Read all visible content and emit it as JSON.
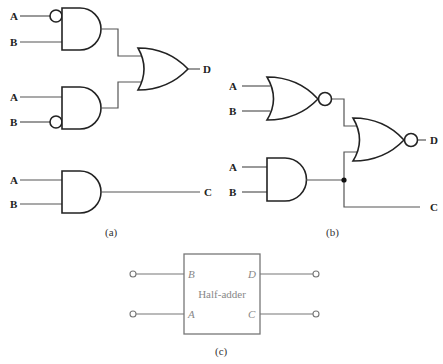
{
  "figure_a": {
    "caption": "(a)",
    "gate1": {
      "type": "AND",
      "inputs": [
        "A",
        "B"
      ],
      "inverted_inputs": [
        "A"
      ]
    },
    "gate2": {
      "type": "AND",
      "inputs": [
        "A",
        "B"
      ],
      "inverted_inputs": [
        "B"
      ]
    },
    "gate3": {
      "type": "OR",
      "output": "D"
    },
    "gate4": {
      "type": "AND",
      "inputs": [
        "A",
        "B"
      ],
      "output": "C"
    },
    "labels": {
      "a1": "A",
      "b1": "B",
      "a2": "A",
      "b2": "B",
      "a3": "A",
      "b3": "B",
      "d": "D",
      "c": "C"
    }
  },
  "figure_b": {
    "caption": "(b)",
    "gate1": {
      "type": "NOR",
      "inputs": [
        "A",
        "B"
      ]
    },
    "gate2": {
      "type": "AND",
      "inputs": [
        "A",
        "B"
      ]
    },
    "gate3": {
      "type": "NOR",
      "output": "D"
    },
    "labels": {
      "a1": "A",
      "b1": "B",
      "a2": "A",
      "b2": "B",
      "d": "D",
      "c": "C"
    }
  },
  "figure_c": {
    "caption": "(c)",
    "block_label": "Half-adder",
    "ports": {
      "in_top": "B",
      "in_bottom": "A",
      "out_top": "D",
      "out_bottom": "C"
    }
  }
}
